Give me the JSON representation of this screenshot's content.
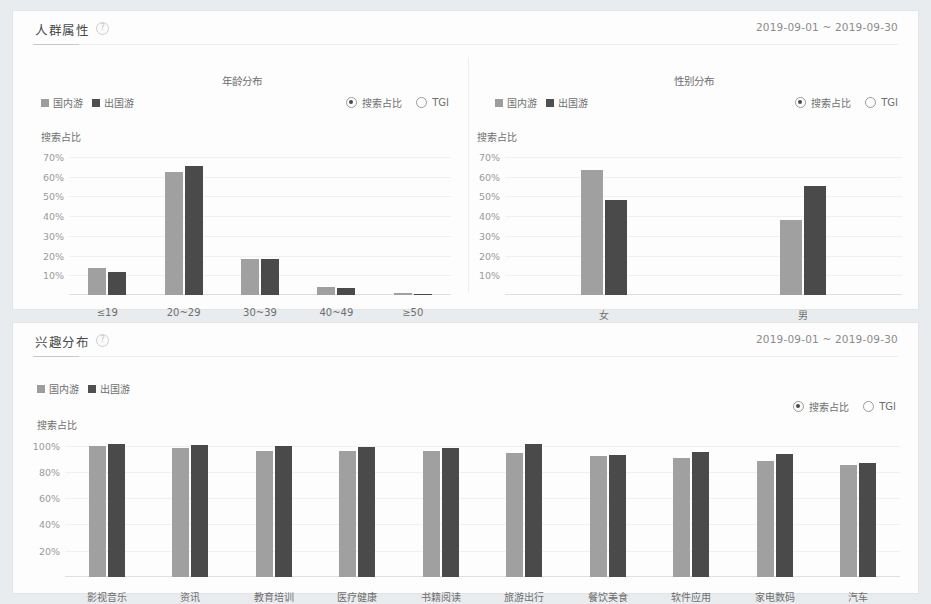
{
  "theme": {
    "page_bg": "#e9ecee",
    "card_bg": "#fdfdfd",
    "domestic_color": "#a0a0a0",
    "abroad_color": "#4a4a4a",
    "text_color": "#6f6f6f",
    "grid_color": "#f0f0f0"
  },
  "panels": [
    {
      "id": "crowd",
      "title": "人群属性",
      "help_icon": "help-circle-icon",
      "date_range": "2019-09-01 ~ 2019-09-30"
    },
    {
      "id": "interest",
      "title": "兴趣分布",
      "help_icon": "help-circle-icon",
      "date_range": "2019-09-01 ~ 2019-09-30"
    }
  ],
  "legend": {
    "domestic": "国内游",
    "abroad": "出国游"
  },
  "metric_toggle": {
    "options": [
      "搜索占比",
      "TGI"
    ],
    "selected": "搜索占比"
  },
  "chart_data": [
    {
      "id": "age-distribution",
      "type": "bar",
      "title": "年龄分布",
      "ylabel": "搜索占比",
      "xlabel": "",
      "categories": [
        "≤19",
        "20~29",
        "30~39",
        "40~49",
        "≥50"
      ],
      "ytick_labels": [
        "10%",
        "20%",
        "30%",
        "40%",
        "50%",
        "60%",
        "70%"
      ],
      "yticks": [
        10,
        20,
        30,
        40,
        50,
        60,
        70
      ],
      "ylim": [
        0,
        75
      ],
      "grid": true,
      "legend_position": "top-left",
      "series": [
        {
          "name": "国内游",
          "color": "#a0a0a0",
          "values": [
            13.5,
            62.5,
            18.5,
            4.0,
            0.8
          ]
        },
        {
          "name": "出国游",
          "color": "#4a4a4a",
          "values": [
            11.5,
            65.5,
            18.0,
            3.5,
            0.6
          ]
        }
      ]
    },
    {
      "id": "gender-distribution",
      "type": "bar",
      "title": "性别分布",
      "ylabel": "搜索占比",
      "xlabel": "",
      "categories": [
        "女",
        "男"
      ],
      "ytick_labels": [
        "10%",
        "20%",
        "30%",
        "40%",
        "50%",
        "60%",
        "70%"
      ],
      "yticks": [
        10,
        20,
        30,
        40,
        50,
        60,
        70
      ],
      "ylim": [
        0,
        75
      ],
      "grid": true,
      "legend_position": "top-left",
      "series": [
        {
          "name": "国内游",
          "color": "#a0a0a0",
          "values": [
            63.5,
            38.0
          ]
        },
        {
          "name": "出国游",
          "color": "#4a4a4a",
          "values": [
            48.0,
            55.0
          ]
        }
      ]
    },
    {
      "id": "interest-distribution",
      "type": "bar",
      "title": "",
      "ylabel": "搜索占比",
      "xlabel": "",
      "categories": [
        "影视音乐",
        "资讯",
        "教育培训",
        "医疗健康",
        "书籍阅读",
        "旅游出行",
        "餐饮美食",
        "软件应用",
        "家电数码",
        "汽车"
      ],
      "ytick_labels": [
        "20%",
        "40%",
        "60%",
        "80%",
        "100%"
      ],
      "yticks": [
        20,
        40,
        60,
        80,
        100
      ],
      "ylim": [
        0,
        108
      ],
      "grid": true,
      "legend_position": "top-left",
      "series": [
        {
          "name": "国内游",
          "color": "#a0a0a0",
          "values": [
            99.5,
            98.5,
            96.0,
            95.5,
            95.5,
            94.0,
            92.0,
            90.5,
            88.5,
            85.5
          ]
        },
        {
          "name": "出国游",
          "color": "#4a4a4a",
          "values": [
            101.5,
            100.5,
            99.5,
            99.0,
            98.5,
            101.5,
            92.5,
            95.0,
            93.5,
            86.5
          ]
        }
      ]
    }
  ]
}
